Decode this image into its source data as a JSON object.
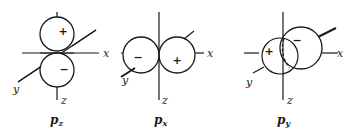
{
  "figure": {
    "panels": [
      {
        "id": "pz",
        "label_main": "p",
        "label_sub": "z",
        "axes": {
          "x": "x",
          "y": "y",
          "z": "z"
        },
        "lobes": [
          {
            "position": "top",
            "sign": "+"
          },
          {
            "position": "bottom",
            "sign": "−"
          }
        ]
      },
      {
        "id": "px",
        "label_main": "p",
        "label_sub": "x",
        "axes": {
          "x": "x",
          "y": "y",
          "z": "z"
        },
        "lobes": [
          {
            "position": "left",
            "sign": "−"
          },
          {
            "position": "right",
            "sign": "+"
          }
        ]
      },
      {
        "id": "py",
        "label_main": "p",
        "label_sub": "y",
        "axes": {
          "x": "x",
          "y": "y",
          "z": "z"
        },
        "lobes": [
          {
            "position": "front",
            "sign": "+"
          },
          {
            "position": "back",
            "sign": "−"
          }
        ]
      }
    ],
    "colors": {
      "ink": "#1a1a1a",
      "background": "#ffffff"
    }
  }
}
